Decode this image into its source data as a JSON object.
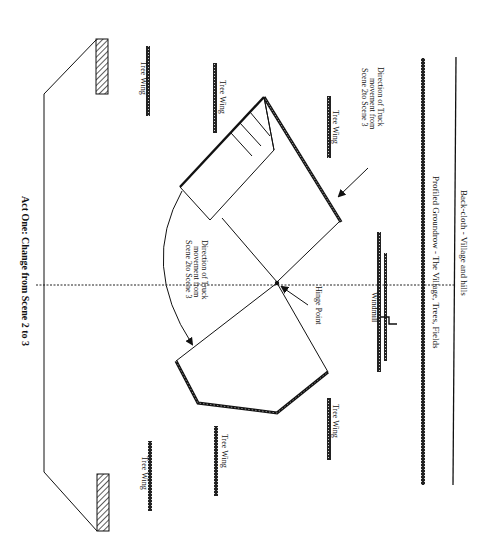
{
  "diagram": {
    "title": "Act One: Change from Scene 2 to 3",
    "orientation": "rotated 90deg clockwise (upstage at right, audience at left)",
    "colors": {
      "ink": "#111111",
      "paper": "#ffffff",
      "hatch": "#444444"
    },
    "labels": {
      "backcloth": "Back-cloth - Village and hills",
      "groundrow": "Profiled Groundrow - The Village, Trees, Fields",
      "windmill": "Windmill",
      "hinge_point": "Hinge Point",
      "direction_top_line1": "Direction of Truck",
      "direction_top_line2": "movement from",
      "direction_top_line3": "Scene 2to Scene 3",
      "direction_mid_line1": "Direction of Truck",
      "direction_mid_line2": "movement from",
      "direction_mid_line3": "Scene 2to Scene 3"
    },
    "tree_wings": [
      {
        "label": "Tree Wing",
        "side": "top",
        "position": "downstage"
      },
      {
        "label": "Tree Wing",
        "side": "top",
        "position": "middle"
      },
      {
        "label": "Tree Wing",
        "side": "top",
        "position": "upstage"
      },
      {
        "label": "Tree Wing",
        "side": "bottom",
        "position": "downstage"
      },
      {
        "label": "Tree Wing",
        "side": "bottom",
        "position": "middle"
      },
      {
        "label": "Tree Wing",
        "side": "bottom",
        "position": "upstage"
      }
    ]
  }
}
